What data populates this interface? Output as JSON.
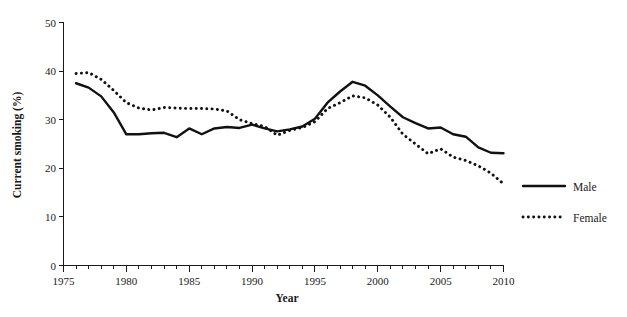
{
  "chart_data": {
    "type": "line",
    "title": "",
    "xlabel": "Year",
    "ylabel": "Current smoking (%)",
    "xlim": [
      1975,
      2010
    ],
    "ylim": [
      0,
      50
    ],
    "grid": false,
    "legend_position": "right",
    "x_ticks": [
      1975,
      1980,
      1985,
      1990,
      1995,
      2000,
      2005,
      2010
    ],
    "x_tick_labels": [
      "1975",
      "1980",
      "1985",
      "1990",
      "1995",
      "2000",
      "2005",
      "2010"
    ],
    "x_minor_tick_interval": 1,
    "y_ticks": [
      0,
      10,
      20,
      30,
      40,
      50
    ],
    "y_tick_labels": [
      "0",
      "10",
      "20",
      "30",
      "40",
      "50"
    ],
    "x": [
      1976,
      1977,
      1978,
      1979,
      1980,
      1981,
      1982,
      1983,
      1984,
      1985,
      1986,
      1987,
      1988,
      1989,
      1990,
      1991,
      1992,
      1993,
      1994,
      1995,
      1996,
      1997,
      1998,
      1999,
      2000,
      2001,
      2002,
      2003,
      2004,
      2005,
      2006,
      2007,
      2008,
      2009,
      2010
    ],
    "series": [
      {
        "name": "Male",
        "style": "solid",
        "color": "#111111",
        "values": [
          37.5,
          36.6,
          34.8,
          31.5,
          27.0,
          27.0,
          27.2,
          27.3,
          26.4,
          28.2,
          27.0,
          28.2,
          28.5,
          28.3,
          29.0,
          28.2,
          27.6,
          28.0,
          28.6,
          30.2,
          33.5,
          35.8,
          37.8,
          37.0,
          35.0,
          32.7,
          30.5,
          29.3,
          28.2,
          28.4,
          27.0,
          26.5,
          24.3,
          23.2,
          23.1
        ]
      },
      {
        "name": "Female",
        "style": "dotted",
        "color": "#111111",
        "values": [
          39.5,
          39.7,
          38.3,
          36.0,
          33.5,
          32.4,
          32.0,
          32.5,
          32.4,
          32.3,
          32.3,
          32.2,
          31.8,
          30.0,
          29.2,
          28.6,
          26.8,
          27.8,
          28.4,
          29.6,
          32.3,
          33.5,
          34.9,
          34.5,
          33.0,
          30.5,
          27.0,
          25.0,
          23.0,
          24.0,
          22.3,
          21.6,
          20.5,
          19.0,
          16.8
        ]
      }
    ],
    "legend_entries": [
      {
        "label": "Male",
        "style": "solid"
      },
      {
        "label": "Female",
        "style": "dotted"
      }
    ]
  }
}
